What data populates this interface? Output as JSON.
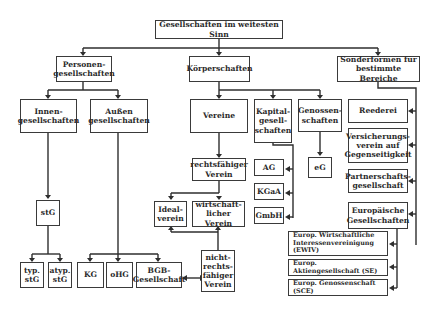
{
  "diagram": {
    "title": "Gesellschaften im weitesten Sinn",
    "nodes": {
      "root": "Gesellschaften im weitesten Sinn",
      "personen": "Personen-\ngesellschaften",
      "koerper": "Körperschaften",
      "sonder": "Sonderformen für\nbestimmte Bereiche",
      "innen": "Innen-\ngesellschaften",
      "aussen": "Außen\ngesellschaften",
      "vereine": "Vereine",
      "kapital": "Kapital-\ngesell-\nschaften",
      "genossen": "Genossen-\nschaften",
      "reederei": "Reederei",
      "versicherung": "Versicherungs-\nverein auf\nGegenseitigkeit",
      "partnerschaft": "Partnerschafts-\ngesellschaft",
      "europaeisch": "Europäische\nGesellschaften",
      "rechtsfaehig": "rechtsfähiger\nVerein",
      "ag": "AG",
      "kgaa": "KGaA",
      "gmbh": "GmbH",
      "eg": "eG",
      "stg": "stG",
      "ideal": "Ideal-\nverein",
      "wirtschaft": "wirtschaft-\nlicher Verein",
      "typ": "typ.\nstG",
      "atyp": "atyp.\nstG",
      "kg": "KG",
      "ohg": "oHG",
      "bgb": "BGB-\nGesellschaft",
      "nichtrechts": "nicht-\nrechts-\nfähiger\nVerein",
      "ewiv": "Europ. Wirtschaftliche\nInteressenvereinigung (EWIV)",
      "se": "Europ. Aktiengesellschaft (SE)",
      "sce": "Europ. Genossenschaft (SCE)"
    }
  },
  "colors": {
    "line": "#2e2e2e",
    "border": "#3a3a3a",
    "text": "#2a2a2a",
    "background": "#ffffff"
  }
}
